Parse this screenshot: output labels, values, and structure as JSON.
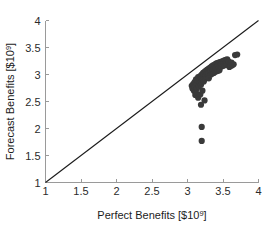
{
  "chart_data": {
    "type": "scatter",
    "title": "",
    "xlabel": "Perfect Benefits [$10",
    "xlabel_exponent": "9",
    "xlabel_suffix": "]",
    "ylabel": "Forecast Benefits [$10",
    "ylabel_exponent": "9",
    "ylabel_suffix": "]",
    "xlim": [
      1,
      4
    ],
    "ylim": [
      1,
      4
    ],
    "grid": false,
    "legend": "none",
    "xticks": [
      1,
      1.5,
      2,
      2.5,
      3,
      3.5,
      4
    ],
    "xticklabels": [
      "1",
      "1.5",
      "2",
      "2.5",
      "3",
      "3.5",
      "4"
    ],
    "yticks": [
      1,
      1.5,
      2,
      2.5,
      3,
      3.5,
      4
    ],
    "yticklabels": [
      "1",
      "1.5",
      "2",
      "2.5",
      "3",
      "3.5",
      "4"
    ],
    "marker_color": "#3a3a3a",
    "marker_size": 3.1,
    "reference_line": {
      "name": "one-to-one-line",
      "x": [
        1,
        4
      ],
      "y": [
        1,
        4
      ],
      "color": "#1a1a1a"
    },
    "points": [
      [
        3.06,
        2.79
      ],
      [
        3.07,
        2.74
      ],
      [
        3.08,
        2.82
      ],
      [
        3.09,
        2.7
      ],
      [
        3.1,
        2.86
      ],
      [
        3.1,
        2.77
      ],
      [
        3.11,
        2.62
      ],
      [
        3.12,
        2.91
      ],
      [
        3.12,
        2.8
      ],
      [
        3.13,
        2.74
      ],
      [
        3.14,
        2.88
      ],
      [
        3.15,
        2.95
      ],
      [
        3.15,
        2.83
      ],
      [
        3.16,
        2.78
      ],
      [
        3.16,
        2.9
      ],
      [
        3.17,
        2.86
      ],
      [
        3.18,
        2.97
      ],
      [
        3.18,
        2.88
      ],
      [
        3.19,
        2.81
      ],
      [
        3.19,
        2.93
      ],
      [
        3.2,
        3.0
      ],
      [
        3.2,
        2.92
      ],
      [
        3.2,
        2.85
      ],
      [
        3.21,
        2.98
      ],
      [
        3.21,
        2.89
      ],
      [
        3.22,
        3.03
      ],
      [
        3.22,
        2.94
      ],
      [
        3.23,
        2.87
      ],
      [
        3.23,
        2.99
      ],
      [
        3.24,
        3.05
      ],
      [
        3.24,
        2.96
      ],
      [
        3.25,
        3.01
      ],
      [
        3.25,
        2.92
      ],
      [
        3.26,
        3.07
      ],
      [
        3.26,
        2.98
      ],
      [
        3.27,
        3.03
      ],
      [
        3.27,
        2.94
      ],
      [
        3.28,
        3.09
      ],
      [
        3.28,
        3.0
      ],
      [
        3.29,
        3.05
      ],
      [
        3.29,
        2.96
      ],
      [
        3.3,
        3.11
      ],
      [
        3.3,
        3.02
      ],
      [
        3.3,
        2.93
      ],
      [
        3.31,
        3.07
      ],
      [
        3.31,
        2.99
      ],
      [
        3.32,
        3.13
      ],
      [
        3.32,
        3.04
      ],
      [
        3.33,
        3.09
      ],
      [
        3.33,
        3.0
      ],
      [
        3.34,
        3.15
      ],
      [
        3.34,
        3.06
      ],
      [
        3.35,
        3.11
      ],
      [
        3.35,
        3.02
      ],
      [
        3.36,
        3.17
      ],
      [
        3.36,
        3.08
      ],
      [
        3.37,
        3.12
      ],
      [
        3.37,
        3.03
      ],
      [
        3.38,
        3.18
      ],
      [
        3.38,
        3.09
      ],
      [
        3.39,
        3.14
      ],
      [
        3.39,
        3.05
      ],
      [
        3.4,
        3.2
      ],
      [
        3.4,
        3.1
      ],
      [
        3.41,
        3.15
      ],
      [
        3.41,
        3.06
      ],
      [
        3.42,
        3.21
      ],
      [
        3.42,
        3.12
      ],
      [
        3.43,
        3.17
      ],
      [
        3.43,
        3.07
      ],
      [
        3.44,
        3.22
      ],
      [
        3.44,
        3.13
      ],
      [
        3.45,
        3.18
      ],
      [
        3.45,
        3.08
      ],
      [
        3.46,
        3.23
      ],
      [
        3.46,
        3.14
      ],
      [
        3.47,
        3.19
      ],
      [
        3.48,
        3.24
      ],
      [
        3.48,
        3.15
      ],
      [
        3.49,
        3.2
      ],
      [
        3.5,
        3.25
      ],
      [
        3.5,
        3.16
      ],
      [
        3.51,
        3.21
      ],
      [
        3.52,
        3.26
      ],
      [
        3.52,
        3.17
      ],
      [
        3.53,
        3.22
      ],
      [
        3.54,
        3.27
      ],
      [
        3.55,
        3.18
      ],
      [
        3.55,
        3.23
      ],
      [
        3.56,
        3.28
      ],
      [
        3.57,
        3.19
      ],
      [
        3.58,
        3.24
      ],
      [
        3.59,
        3.14
      ],
      [
        3.6,
        3.2
      ],
      [
        3.61,
        3.16
      ],
      [
        3.62,
        3.22
      ],
      [
        3.63,
        3.17
      ],
      [
        3.65,
        3.19
      ],
      [
        3.67,
        3.36
      ],
      [
        3.7,
        3.37
      ],
      [
        3.12,
        2.66
      ],
      [
        3.15,
        2.57
      ],
      [
        3.18,
        2.63
      ],
      [
        3.21,
        2.7
      ],
      [
        3.24,
        2.52
      ],
      [
        3.19,
        2.44
      ],
      [
        3.2,
        2.03
      ],
      [
        3.2,
        1.77
      ]
    ]
  }
}
